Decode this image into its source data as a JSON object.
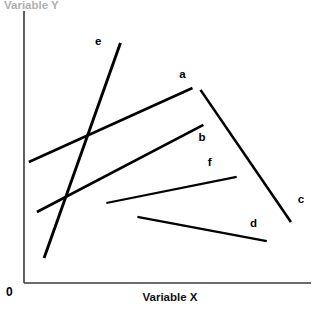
{
  "chart_data": {
    "type": "line",
    "title": "",
    "subtitle": "",
    "xlabel": "Variable X",
    "ylabel": "Variable Y",
    "origin_label": "0",
    "grid": false,
    "legend_position": "inline-end-labels",
    "axis_ticks": [],
    "xlim": [
      0,
      100
    ],
    "ylim": [
      0,
      100
    ],
    "note": "Schematic line plot: six unlabeled-value straight segments annotated a-f at their ends.",
    "series": [
      {
        "name": "a",
        "label": "a",
        "x": [
          1.7,
          58.7
        ],
        "y": [
          44.5,
          71.7
        ],
        "stroke_width": 2.6,
        "label_x": 55.2,
        "label_y": 76.5
      },
      {
        "name": "b",
        "label": "b",
        "x": [
          4.5,
          62.5
        ],
        "y": [
          26.1,
          58.1
        ],
        "stroke_width": 2.6,
        "label_x": 62.0,
        "label_y": 53.3
      },
      {
        "name": "c",
        "label": "c",
        "x": [
          61.5,
          93.0
        ],
        "y": [
          71.0,
          22.4
        ],
        "stroke_width": 2.6,
        "label_x": 96.5,
        "label_y": 30.5
      },
      {
        "name": "d",
        "label": "d",
        "x": [
          39.5,
          84.6
        ],
        "y": [
          24.3,
          15.4
        ],
        "stroke_width": 2.2,
        "label_x": 80.0,
        "label_y": 21.7
      },
      {
        "name": "e",
        "label": "e",
        "x": [
          7.0,
          33.6
        ],
        "y": [
          9.2,
          88.2
        ],
        "stroke_width": 2.9,
        "label_x": 25.9,
        "label_y": 88.6
      },
      {
        "name": "f",
        "label": "f",
        "x": [
          28.7,
          74.1
        ],
        "y": [
          29.4,
          39.0
        ],
        "stroke_width": 2.2,
        "label_x": 64.7,
        "label_y": 44.1
      }
    ]
  },
  "axes": {
    "x_axis": {
      "x1": 0,
      "y1": 0,
      "x2": 100,
      "y2": 0
    },
    "y_axis": {
      "x1": 0,
      "y1": 0,
      "x2": 0,
      "y2": 100
    }
  }
}
